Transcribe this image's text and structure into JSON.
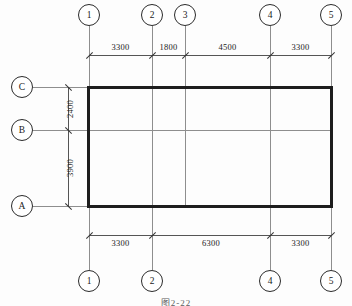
{
  "drawing": {
    "title": "Structural Floor Plan Grid",
    "caption": "图2-22",
    "line_color": "#1d1d1d",
    "grid_color": "#8e8e8e",
    "dim_color": "#333333"
  },
  "column_grid": {
    "top_bubbles": [
      {
        "label": "1",
        "x": 89
      },
      {
        "label": "2",
        "x": 152
      },
      {
        "label": "3",
        "x": 185
      },
      {
        "label": "4",
        "x": 270
      },
      {
        "label": "5",
        "x": 331
      }
    ],
    "bottom_bubbles": [
      {
        "label": "1",
        "x": 89
      },
      {
        "label": "2",
        "x": 152
      },
      {
        "label": "4",
        "x": 270
      },
      {
        "label": "5",
        "x": 331
      }
    ]
  },
  "row_grid": {
    "bubbles": [
      {
        "label": "C",
        "y": 87
      },
      {
        "label": "B",
        "y": 130
      },
      {
        "label": "A",
        "y": 206
      }
    ]
  },
  "dimensions": {
    "top_chain": {
      "y": 55,
      "segments": [
        {
          "value": "3300",
          "x1": 89,
          "x2": 152
        },
        {
          "value": "1800",
          "x1": 152,
          "x2": 185
        },
        {
          "value": "4500",
          "x1": 185,
          "x2": 270
        },
        {
          "value": "3300",
          "x1": 270,
          "x2": 331
        }
      ]
    },
    "bottom_chain": {
      "y": 235,
      "segments": [
        {
          "value": "3300",
          "x1": 89,
          "x2": 152
        },
        {
          "value": "6300",
          "x1": 152,
          "x2": 270
        },
        {
          "value": "3300",
          "x1": 270,
          "x2": 331
        }
      ]
    },
    "left_chain": {
      "x": 68,
      "segments": [
        {
          "value": "2400",
          "y1": 87,
          "y2": 130
        },
        {
          "value": "3900",
          "y1": 130,
          "y2": 206
        }
      ]
    }
  },
  "walls": {
    "outline": {
      "left": 88,
      "top": 87,
      "right": 331,
      "bottom": 206,
      "thickness": 3
    },
    "interior_lines": [
      {
        "type": "vertical",
        "x": 152,
        "y1": 87,
        "y2": 206
      },
      {
        "type": "vertical",
        "x": 185,
        "y1": 87,
        "y2": 206
      },
      {
        "type": "vertical",
        "x": 270,
        "y1": 87,
        "y2": 206
      },
      {
        "type": "horizontal",
        "y": 130,
        "x1": 88,
        "x2": 331
      }
    ]
  }
}
